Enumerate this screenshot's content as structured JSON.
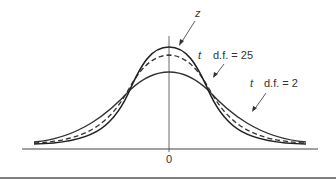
{
  "diagram": {
    "title": "",
    "curves": [
      {
        "id": "z",
        "label": "z",
        "style": "solid",
        "peak": "highest"
      },
      {
        "id": "t25",
        "label_var": "t",
        "label_df": "d.f. = 25",
        "style": "dashed",
        "peak": "middle"
      },
      {
        "id": "t2",
        "label_var": "t",
        "label_df": "d.f. = 2",
        "style": "solid",
        "peak": "lowest"
      }
    ],
    "x_axis": {
      "center_tick": "0"
    },
    "colors": {
      "ink": "#333333",
      "background": "#ffffff"
    }
  }
}
